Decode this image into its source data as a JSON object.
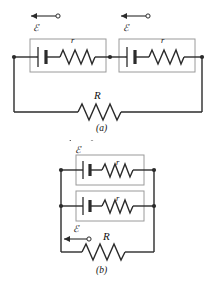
{
  "figure": {
    "type": "circuit-diagram",
    "colors": {
      "wire": "#2b2b2b",
      "box_outline": "#9a9a9a",
      "background": "#ffffff",
      "text": "#111111"
    },
    "panels": [
      {
        "id": "a",
        "caption": "(a)",
        "arrangement": "series",
        "cells": [
          {
            "emf_label": "ℰ",
            "internal_resistance_label": "r",
            "arrow_direction": "left",
            "arrow_marker": "open-circle-right"
          },
          {
            "emf_label": "ℰ",
            "internal_resistance_label": "r",
            "arrow_direction": "left",
            "arrow_marker": "open-circle-right"
          }
        ],
        "external_resistor_label": "R",
        "node_count": 3
      },
      {
        "id": "b",
        "caption": "(b)",
        "arrangement": "parallel",
        "cells": [
          {
            "emf_label": "ℰ",
            "internal_resistance_label": "r",
            "arrow_direction": "left",
            "arrow_marker": "open-circle-right"
          },
          {
            "emf_label": "ℰ",
            "internal_resistance_label": "r",
            "arrow_direction": "left",
            "arrow_marker": "open-circle-right"
          }
        ],
        "external_resistor_label": "R",
        "node_count": 4
      }
    ],
    "labels": {
      "emf": "ℰ",
      "internal_resistance": "r",
      "external_resistance": "R",
      "caption_a": "(a)",
      "caption_b": "(b)"
    }
  }
}
